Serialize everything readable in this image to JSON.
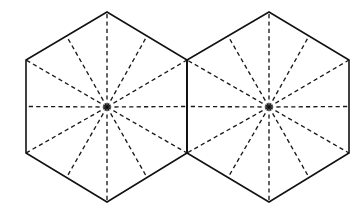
{
  "figure": {
    "canvas": {
      "width": 364,
      "height": 219,
      "background": "#ffffff"
    },
    "stroke_colors": {
      "outline": "#121212",
      "dashed": "#1a1a1a"
    },
    "stroke_widths": {
      "outline": 1.6,
      "dashed": 1.35
    },
    "dash_pattern": "4.2 3.2"
  },
  "chart_data": {
    "type": "diagram",
    "shape": "regular-hexagon",
    "orientation": "pointy-top",
    "count": 2,
    "shared_edge": {
      "x1": 187,
      "y1": 60,
      "x2": 187,
      "y2": 153
    },
    "circumradius": 95,
    "inradius": 81,
    "spokes_per_hexagon": 12,
    "spoke_angle_step_degrees": 30,
    "hexagons": [
      {
        "name": "left-hexagon",
        "center": {
          "x": 107,
          "y": 107
        },
        "vertices": [
          {
            "label": "top",
            "x": 107,
            "y": 12
          },
          {
            "label": "upper-right",
            "x": 187,
            "y": 60
          },
          {
            "label": "lower-right",
            "x": 187,
            "y": 153
          },
          {
            "label": "bottom",
            "x": 107,
            "y": 202
          },
          {
            "label": "lower-left",
            "x": 26,
            "y": 153
          },
          {
            "label": "upper-left",
            "x": 26,
            "y": 60
          }
        ],
        "edge_midpoints": [
          {
            "label": "upper-right-edge",
            "x": 147,
            "y": 36
          },
          {
            "label": "right-edge",
            "x": 187,
            "y": 106.5
          },
          {
            "label": "lower-right-edge",
            "x": 147,
            "y": 177.5
          },
          {
            "label": "lower-left-edge",
            "x": 66.5,
            "y": 177.5
          },
          {
            "label": "left-edge",
            "x": 26,
            "y": 106.5
          },
          {
            "label": "upper-left-edge",
            "x": 66.5,
            "y": 36
          }
        ]
      },
      {
        "name": "right-hexagon",
        "center": {
          "x": 269,
          "y": 107
        },
        "vertices": [
          {
            "label": "top",
            "x": 269,
            "y": 12
          },
          {
            "label": "upper-right",
            "x": 349,
            "y": 60
          },
          {
            "label": "lower-right",
            "x": 349,
            "y": 153
          },
          {
            "label": "bottom",
            "x": 269,
            "y": 202
          },
          {
            "label": "lower-left",
            "x": 187,
            "y": 153
          },
          {
            "label": "upper-left",
            "x": 187,
            "y": 60
          }
        ],
        "edge_midpoints": [
          {
            "label": "upper-right-edge",
            "x": 309,
            "y": 36
          },
          {
            "label": "right-edge",
            "x": 349,
            "y": 106.5
          },
          {
            "label": "lower-right-edge",
            "x": 309,
            "y": 177.5
          },
          {
            "label": "lower-left-edge",
            "x": 228,
            "y": 177.5
          },
          {
            "label": "left-edge",
            "x": 187,
            "y": 106.5
          },
          {
            "label": "upper-left-edge",
            "x": 228,
            "y": 36
          }
        ]
      }
    ],
    "legend": [],
    "annotations": [],
    "grid": false
  }
}
